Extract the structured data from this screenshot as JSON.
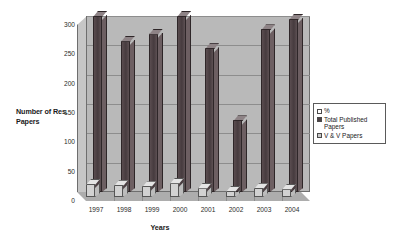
{
  "chart_data": {
    "type": "bar",
    "title": "",
    "xlabel": "Years",
    "ylabel": "Number of Res. Papers",
    "categories": [
      "1997",
      "1998",
      "1999",
      "2000",
      "2001",
      "2002",
      "2003",
      "2004"
    ],
    "series": [
      {
        "name": "Total Published Papers",
        "values": [
          300,
          258,
          270,
          300,
          245,
          122,
          277,
          295
        ],
        "color": "#4d4144"
      },
      {
        "name": "V & V Papers",
        "values": [
          22,
          20,
          18,
          24,
          16,
          10,
          15,
          14
        ],
        "color": "#d2d2d2"
      }
    ],
    "ylim": [
      0,
      300
    ],
    "yticks": [
      0,
      50,
      100,
      150,
      200,
      250,
      300
    ],
    "ytick_labels": [
      "0",
      "50",
      "100",
      "150",
      "200",
      "250",
      "300"
    ],
    "grid": true,
    "legend_position": "right",
    "legend_entries": [
      "%",
      "Total Published Papers",
      "V & V Papers"
    ],
    "style": "3d-column"
  },
  "axes": {
    "y_title_line1": "Number of Res.",
    "y_title_line2": "Papers",
    "x_title": "Years"
  },
  "legend": {
    "entries": [
      {
        "key": "percent",
        "label": "%"
      },
      {
        "key": "total-published-papers",
        "label": "Total Published Papers"
      },
      {
        "key": "v-and-v-papers",
        "label": "V & V Papers"
      }
    ]
  }
}
